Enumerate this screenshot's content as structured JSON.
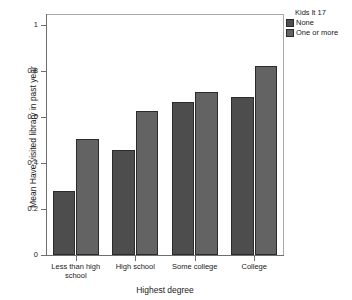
{
  "chart_data": {
    "type": "bar",
    "title": "",
    "subtitle": "",
    "xlabel": "Highest degree",
    "ylabel": "Mean Have visited library in past year",
    "categories": [
      "Less than high school",
      "High school",
      "Some college",
      "College"
    ],
    "series": [
      {
        "name": "None",
        "values": [
          0.28,
          0.455,
          0.665,
          0.685
        ],
        "color": "#4d4d4d"
      },
      {
        "name": "One or more",
        "values": [
          0.505,
          0.625,
          0.71,
          0.82
        ],
        "color": "#636363"
      }
    ],
    "legend": {
      "title": "Kids lt 17",
      "position": "right",
      "entries": [
        "None",
        "One or more"
      ]
    },
    "ylim": [
      0,
      1
    ],
    "yticks": [
      0,
      0.2,
      0.4,
      0.6,
      0.8,
      1
    ],
    "ytick_labels": [
      "0",
      "0.2",
      "0.4",
      "0.6",
      "0.8",
      "1"
    ],
    "grid": false,
    "grouping": "grouped",
    "bar_border_color": "#2b2b2b",
    "axis_color": "#6e6e6e",
    "background": "#ffffff"
  }
}
